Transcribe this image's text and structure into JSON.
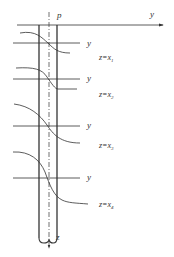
{
  "diagram": {
    "type": "pile-deflection-diagram",
    "labels": {
      "pile": "p",
      "horizontal_axis": "y",
      "vertical_axis": "z"
    },
    "sections": [
      {
        "axis_label": "y",
        "depth_label": "z=x",
        "depth_sub": "1"
      },
      {
        "axis_label": "y",
        "depth_label": "z=x",
        "depth_sub": "2"
      },
      {
        "axis_label": "y",
        "depth_label": "z=x",
        "depth_sub": "3"
      },
      {
        "axis_label": "y",
        "depth_label": "z=x",
        "depth_sub": "4"
      }
    ],
    "colors": {
      "stroke": "#333333",
      "background": "#ffffff"
    }
  }
}
